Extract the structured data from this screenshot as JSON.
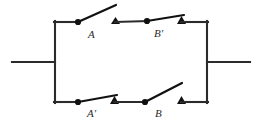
{
  "diagram": {
    "type": "electrical-schematic",
    "canvas": {
      "width": 264,
      "height": 124
    },
    "colors": {
      "wire": "#2b2b2b",
      "lever": "#111111",
      "contact": "#111111",
      "label": "#2a2a2a",
      "background": "#ffffff"
    },
    "geometry": {
      "rail_left_x": 54,
      "rail_right_x": 208,
      "rail_top_y": 22,
      "rail_bottom_y": 102,
      "lead_y": 62,
      "lead_left_start_x": 12,
      "lead_right_end_x": 250
    },
    "leads": [
      {
        "name": "left-lead",
        "x1": 12,
        "y1": 62,
        "x2": 54,
        "y2": 62
      },
      {
        "name": "right-lead",
        "x1": 208,
        "y1": 62,
        "x2": 250,
        "y2": 62
      }
    ],
    "branches": [
      {
        "name": "top-branch",
        "y": 22,
        "switches": [
          {
            "id": "A",
            "label": "A",
            "state": "open",
            "pivot": {
              "x": 78,
              "y": 22
            },
            "lever_end": {
              "x": 116,
              "y": 5
            },
            "label_pos": {
              "x": 88,
              "y": 37
            },
            "contact": null,
            "wire_in": {
              "x1": 54,
              "y1": 22,
              "x2": 78,
              "y2": 22
            }
          },
          {
            "id": "Bprime",
            "label": "B'",
            "state": "closed",
            "pivot": {
              "x": 147,
              "y": 21
            },
            "lever_end": {
              "x": 181,
              "y": 17
            },
            "label_pos": {
              "x": 155,
              "y": 36
            },
            "contact": {
              "x": 181,
              "y": 21,
              "kind": "triangle"
            },
            "lead_contact": {
              "x": 116,
              "y": 22,
              "kind": "triangle"
            },
            "wire_in": {
              "x1": 116,
              "y1": 22,
              "x2": 147,
              "y2": 21
            },
            "wire_out": {
              "x1": 181,
              "y1": 22,
              "x2": 208,
              "y2": 22
            }
          }
        ]
      },
      {
        "name": "bottom-branch",
        "y": 102,
        "switches": [
          {
            "id": "Aprime",
            "label": "A'",
            "state": "closed",
            "pivot": {
              "x": 78,
              "y": 102
            },
            "lever_end": {
              "x": 114,
              "y": 96
            },
            "label_pos": {
              "x": 88,
              "y": 116
            },
            "contact": {
              "x": 114,
              "y": 100,
              "kind": "triangle"
            },
            "wire_in": {
              "x1": 54,
              "y1": 102,
              "x2": 78,
              "y2": 102
            },
            "wire_out": {
              "x1": 114,
              "y1": 102,
              "x2": 145,
              "y2": 102
            }
          },
          {
            "id": "B",
            "label": "B",
            "state": "open",
            "pivot": {
              "x": 145,
              "y": 102
            },
            "lever_end": {
              "x": 182,
              "y": 83
            },
            "label_pos": {
              "x": 155,
              "y": 116
            },
            "contact": {
              "x": 181,
              "y": 101,
              "kind": "triangle"
            },
            "wire_out": {
              "x1": 181,
              "y1": 102,
              "x2": 208,
              "y2": 102
            }
          }
        ]
      }
    ],
    "labels": [
      {
        "id": "label-A",
        "text": "A"
      },
      {
        "id": "label-Bprime",
        "text": "B'"
      },
      {
        "id": "label-Aprime",
        "text": "A'"
      },
      {
        "id": "label-B",
        "text": "B"
      }
    ]
  }
}
